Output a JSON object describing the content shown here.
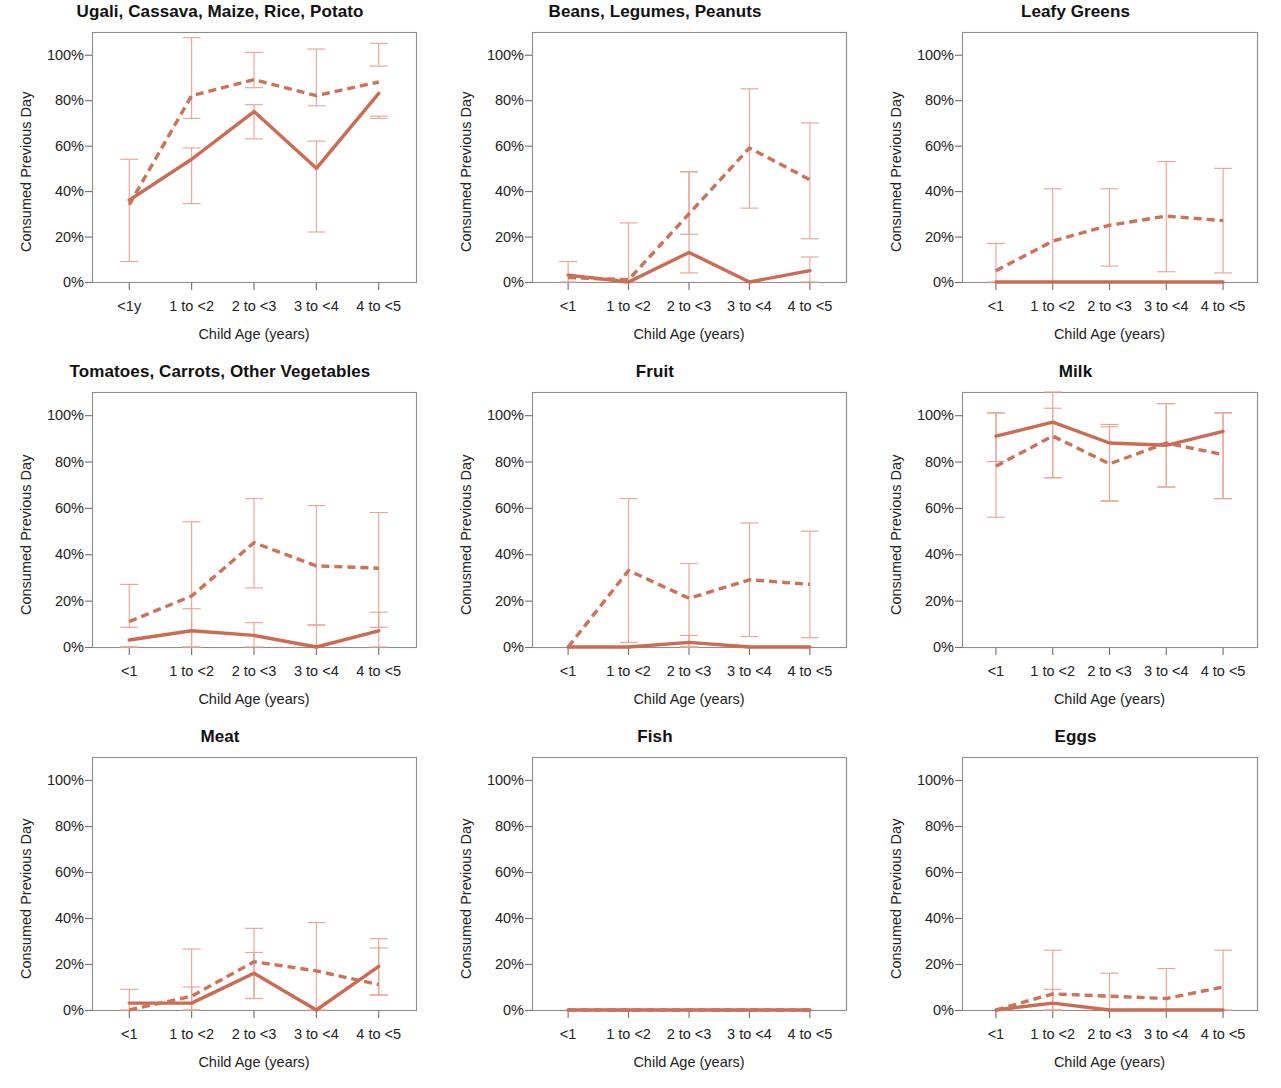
{
  "figure": {
    "ylabel_default": "Consumed Previous Day",
    "xlabel_default": "Child Age (years)",
    "colors": {
      "solid_line": "#CC6B52",
      "dashed_line": "#CE7157",
      "error_bar": "#E9A596",
      "frame": "#8D8D8D",
      "text": "#1A1A1A",
      "background": "#FFFFFF"
    }
  },
  "chart_data": [
    {
      "type": "line",
      "title": "Ugali, Cassava, Maize, Rice, Potato",
      "xlabel": "Child Age (years)",
      "ylabel": "Consumed Previous Day",
      "categories": [
        "<1y",
        "1 to <2",
        "2 to <3",
        "3 to <4",
        "4 to <5"
      ],
      "ytick_labels": [
        "0%",
        "20%",
        "40%",
        "60%",
        "80%",
        "100%"
      ],
      "ytick_values": [
        0,
        20,
        40,
        60,
        80,
        100
      ],
      "ylim": [
        0,
        110
      ],
      "grid": false,
      "legend": "none",
      "series": [
        {
          "name": "solid",
          "style": "solid",
          "values": [
            36,
            54,
            75,
            50,
            83
          ],
          "err_low": [
            null,
            34.5,
            63,
            22,
            72
          ],
          "err_high": [
            null,
            59,
            78,
            62,
            73
          ]
        },
        {
          "name": "dashed",
          "style": "dashed",
          "values": [
            34,
            82,
            89,
            82,
            88
          ],
          "err_low": [
            9,
            72,
            85.5,
            77.5,
            95
          ],
          "err_high": [
            54,
            107.5,
            101,
            102.5,
            105
          ]
        }
      ]
    },
    {
      "type": "line",
      "title": "Beans, Legumes, Peanuts",
      "xlabel": "Child Age (years)",
      "ylabel": "Consumed Previous Day",
      "categories": [
        "<1",
        "1 to <2",
        "2 to <3",
        "3 to <4",
        "4 to <5"
      ],
      "ytick_labels": [
        "0%",
        "20%",
        "40%",
        "60%",
        "80%",
        "100%"
      ],
      "ytick_values": [
        0,
        20,
        40,
        60,
        80,
        100
      ],
      "ylim": [
        0,
        110
      ],
      "grid": false,
      "legend": "none",
      "series": [
        {
          "name": "solid",
          "style": "solid",
          "values": [
            3,
            0,
            13,
            0,
            5
          ],
          "err_low": [
            0,
            null,
            4,
            null,
            0
          ],
          "err_high": [
            9,
            null,
            48.5,
            null,
            11
          ]
        },
        {
          "name": "dashed",
          "style": "dashed",
          "values": [
            2,
            1,
            30,
            59,
            45
          ],
          "err_low": [
            null,
            0,
            21,
            32.5,
            19
          ],
          "err_high": [
            null,
            26,
            48.5,
            85,
            70
          ]
        }
      ]
    },
    {
      "type": "line",
      "title": "Leafy Greens",
      "xlabel": "Child Age (years)",
      "ylabel": "Consumed Previous Day",
      "categories": [
        "<1",
        "1 to <2",
        "2 to <3",
        "3 to <4",
        "4 to <5"
      ],
      "ytick_labels": [
        "0%",
        "20%",
        "40%",
        "60%",
        "80%",
        "100%"
      ],
      "ytick_values": [
        0,
        20,
        40,
        60,
        80,
        100
      ],
      "ylim": [
        0,
        110
      ],
      "grid": false,
      "legend": "none",
      "series": [
        {
          "name": "solid",
          "style": "solid",
          "values": [
            0,
            0,
            0,
            0,
            0
          ],
          "err_low": [
            null,
            null,
            null,
            null,
            null
          ],
          "err_high": [
            null,
            null,
            null,
            null,
            null
          ]
        },
        {
          "name": "dashed",
          "style": "dashed",
          "values": [
            5,
            18,
            25,
            29,
            27
          ],
          "err_low": [
            0,
            0,
            7,
            4.5,
            4
          ],
          "err_high": [
            17,
            41,
            41,
            53,
            50
          ]
        }
      ]
    },
    {
      "type": "line",
      "title": "Tomatoes, Carrots, Other Vegetables",
      "xlabel": "Child Age (years)",
      "ylabel": "Consumed Previous Day",
      "categories": [
        "<1",
        "1 to <2",
        "2 to <3",
        "3 to <4",
        "4 to <5"
      ],
      "ytick_labels": [
        "0%",
        "20%",
        "40%",
        "60%",
        "80%",
        "100%"
      ],
      "ytick_values": [
        0,
        20,
        40,
        60,
        80,
        100
      ],
      "ylim": [
        0,
        110
      ],
      "grid": false,
      "legend": "none",
      "series": [
        {
          "name": "solid",
          "style": "solid",
          "values": [
            3,
            7,
            5,
            0,
            7
          ],
          "err_low": [
            0,
            0,
            0,
            null,
            0
          ],
          "err_high": [
            0,
            16.5,
            10.5,
            9.5,
            15
          ]
        },
        {
          "name": "dashed",
          "style": "dashed",
          "values": [
            11,
            22,
            45,
            35,
            34
          ],
          "err_low": [
            8.5,
            0,
            25.5,
            9.5,
            8.5
          ],
          "err_high": [
            27,
            54,
            64,
            61,
            58
          ]
        }
      ]
    },
    {
      "type": "line",
      "title": "Fruit",
      "xlabel": "Child Age (years)",
      "ylabel": "Conusmed Previous Day",
      "categories": [
        "<1",
        "1 to <2",
        "2 to <3",
        "3 to <4",
        "4 to <5"
      ],
      "ytick_labels": [
        "0%",
        "20%",
        "40%",
        "60%",
        "80%",
        "100%"
      ],
      "ytick_values": [
        0,
        20,
        40,
        60,
        80,
        100
      ],
      "ylim": [
        0,
        110
      ],
      "grid": false,
      "legend": "none",
      "series": [
        {
          "name": "solid",
          "style": "solid",
          "values": [
            0,
            0,
            2,
            0,
            0
          ],
          "err_low": [
            null,
            null,
            0,
            null,
            null
          ],
          "err_high": [
            null,
            null,
            5,
            null,
            null
          ]
        },
        {
          "name": "dashed",
          "style": "dashed",
          "values": [
            0,
            33,
            21,
            29,
            27
          ],
          "err_low": [
            null,
            2,
            0,
            4.5,
            4
          ],
          "err_high": [
            null,
            64,
            36,
            53.5,
            50
          ]
        }
      ]
    },
    {
      "type": "line",
      "title": "Milk",
      "xlabel": "Child Age (years)",
      "ylabel": "Consumed Previous Day",
      "categories": [
        "<1",
        "1 to <2",
        "2 to <3",
        "3 to <4",
        "4 to <5"
      ],
      "ytick_labels": [
        "0%",
        "20%",
        "40%",
        "60%",
        "80%",
        "100%"
      ],
      "ytick_values": [
        0,
        20,
        40,
        60,
        80,
        100
      ],
      "ylim": [
        0,
        110
      ],
      "grid": false,
      "legend": "none",
      "series": [
        {
          "name": "solid",
          "style": "solid",
          "values": [
            91,
            97,
            88,
            87,
            93
          ],
          "err_low": [
            80,
            73,
            63,
            69,
            64
          ],
          "err_high": [
            101,
            110,
            95,
            105,
            101
          ]
        },
        {
          "name": "dashed",
          "style": "dashed",
          "values": [
            78,
            91,
            79,
            88,
            83
          ],
          "err_low": [
            56,
            73,
            63,
            69,
            64
          ],
          "err_high": [
            101,
            103,
            96,
            105,
            101
          ]
        }
      ]
    },
    {
      "type": "line",
      "title": "Meat",
      "xlabel": "Child Age (years)",
      "ylabel": "Consumed Previous Day",
      "categories": [
        "<1",
        "1 to <2",
        "2 to <3",
        "3 to <4",
        "4 to <5"
      ],
      "ytick_labels": [
        "0%",
        "20%",
        "40%",
        "60%",
        "80%",
        "100%"
      ],
      "ytick_values": [
        0,
        20,
        40,
        60,
        80,
        100
      ],
      "ylim": [
        0,
        110
      ],
      "grid": false,
      "legend": "none",
      "series": [
        {
          "name": "solid",
          "style": "solid",
          "values": [
            3,
            3,
            16,
            0,
            19
          ],
          "err_low": [
            0,
            0,
            5,
            null,
            6.5
          ],
          "err_high": [
            9,
            10,
            25,
            null,
            27
          ]
        },
        {
          "name": "dashed",
          "style": "dashed",
          "values": [
            0,
            6,
            21,
            17,
            11
          ],
          "err_low": [
            null,
            0,
            5,
            0,
            6.5
          ],
          "err_high": [
            null,
            26.5,
            35.5,
            38,
            31
          ]
        }
      ]
    },
    {
      "type": "line",
      "title": "Fish",
      "xlabel": "Child Age (years)",
      "ylabel": "Consumed Previous Day",
      "categories": [
        "<1",
        "1 to <2",
        "2 to <3",
        "3 to <4",
        "4 to <5"
      ],
      "ytick_labels": [
        "0%",
        "20%",
        "40%",
        "60%",
        "80%",
        "100%"
      ],
      "ytick_values": [
        0,
        20,
        40,
        60,
        80,
        100
      ],
      "ylim": [
        0,
        110
      ],
      "grid": false,
      "legend": "none",
      "series": [
        {
          "name": "solid",
          "style": "solid",
          "values": [
            0,
            0,
            0,
            0,
            0
          ],
          "err_low": [
            null,
            null,
            null,
            null,
            null
          ],
          "err_high": [
            null,
            null,
            null,
            null,
            null
          ]
        },
        {
          "name": "dashed",
          "style": "dashed",
          "values": [
            0,
            0,
            0,
            0,
            0
          ],
          "err_low": [
            null,
            null,
            null,
            null,
            null
          ],
          "err_high": [
            null,
            null,
            null,
            null,
            null
          ]
        }
      ]
    },
    {
      "type": "line",
      "title": "Eggs",
      "xlabel": "Child Age (years)",
      "ylabel": "Consumed Previous Day",
      "categories": [
        "<1",
        "1 to <2",
        "2 to <3",
        "3 to <4",
        "4 to <5"
      ],
      "ytick_labels": [
        "0%",
        "20%",
        "40%",
        "60%",
        "80%",
        "100%"
      ],
      "ytick_values": [
        0,
        20,
        40,
        60,
        80,
        100
      ],
      "ylim": [
        0,
        110
      ],
      "grid": false,
      "legend": "none",
      "series": [
        {
          "name": "solid",
          "style": "solid",
          "values": [
            0,
            3,
            0,
            0,
            0
          ],
          "err_low": [
            null,
            0,
            null,
            null,
            null
          ],
          "err_high": [
            null,
            9,
            null,
            null,
            null
          ]
        },
        {
          "name": "dashed",
          "style": "dashed",
          "values": [
            0,
            7,
            6,
            5,
            10
          ],
          "err_low": [
            null,
            0,
            0,
            0,
            0
          ],
          "err_high": [
            null,
            26,
            16,
            18,
            26
          ]
        }
      ]
    }
  ]
}
